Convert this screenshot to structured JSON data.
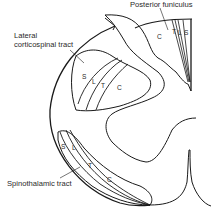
{
  "diagram": {
    "labels": {
      "posterior_funiculus": "Posterior funiculus",
      "lateral_cst_line1": "Lateral",
      "lateral_cst_line2": "corticospinal tract",
      "spinothalamic": "Spinothalamic tract"
    },
    "posterior_funiculus_segments": [
      "C",
      "T",
      "L",
      "S"
    ],
    "lateral_corticospinal_segments": [
      "S",
      "L",
      "T",
      "C"
    ],
    "spinothalamic_segments": [
      "S",
      "L",
      "T",
      "C"
    ],
    "colors": {
      "line": "#1a1a1a",
      "text": "#2a2a2a",
      "background": "#ffffff"
    }
  }
}
